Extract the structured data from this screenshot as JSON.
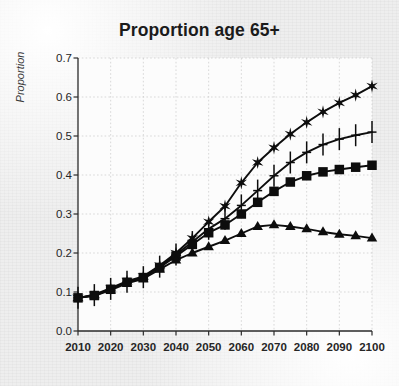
{
  "chart_data": {
    "type": "line",
    "title": "Proportion age 65+",
    "xlabel": "",
    "ylabel": "Proportion",
    "xlim": [
      2010,
      2100
    ],
    "ylim": [
      0.0,
      0.7
    ],
    "ytick_labels": [
      "0.0",
      "0.1",
      "0.2",
      "0.3",
      "0.4",
      "0.5",
      "0.6",
      "0.7"
    ],
    "ytick_values": [
      0.0,
      0.1,
      0.2,
      0.3,
      0.4,
      0.5,
      0.6,
      0.7
    ],
    "xtick_labels": [
      "2010",
      "2020",
      "2030",
      "2040",
      "2050",
      "2060",
      "2070",
      "2080",
      "2090",
      "2100"
    ],
    "xtick_values": [
      2010,
      2020,
      2030,
      2040,
      2050,
      2060,
      2070,
      2080,
      2090,
      2100
    ],
    "grid": true,
    "legend": "none",
    "x": [
      2010,
      2015,
      2020,
      2025,
      2030,
      2035,
      2040,
      2045,
      2050,
      2055,
      2060,
      2065,
      2070,
      2075,
      2080,
      2085,
      2090,
      2095,
      2100
    ],
    "series": [
      {
        "name": "star-series",
        "marker": "star",
        "values": [
          0.085,
          0.093,
          0.11,
          0.128,
          0.14,
          0.168,
          0.2,
          0.238,
          0.28,
          0.32,
          0.38,
          0.432,
          0.47,
          0.505,
          0.535,
          0.562,
          0.585,
          0.605,
          0.628
        ]
      },
      {
        "name": "plus-series",
        "marker": "plus",
        "values": [
          0.085,
          0.092,
          0.108,
          0.126,
          0.138,
          0.165,
          0.196,
          0.228,
          0.262,
          0.288,
          0.322,
          0.36,
          0.398,
          0.432,
          0.458,
          0.478,
          0.492,
          0.502,
          0.51
        ]
      },
      {
        "name": "square-series",
        "marker": "square",
        "values": [
          0.085,
          0.091,
          0.107,
          0.125,
          0.137,
          0.163,
          0.192,
          0.222,
          0.252,
          0.272,
          0.3,
          0.33,
          0.358,
          0.382,
          0.398,
          0.408,
          0.414,
          0.42,
          0.425
        ]
      },
      {
        "name": "triangle-series",
        "marker": "triangle",
        "values": [
          0.085,
          0.09,
          0.105,
          0.122,
          0.134,
          0.158,
          0.182,
          0.2,
          0.216,
          0.232,
          0.25,
          0.268,
          0.272,
          0.268,
          0.262,
          0.254,
          0.248,
          0.244,
          0.238
        ]
      }
    ]
  }
}
